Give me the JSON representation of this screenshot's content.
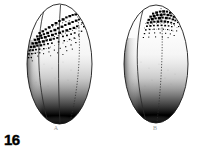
{
  "figure": {
    "number": "16",
    "domain_type": "scientific-illustration",
    "background_color": "#ffffff",
    "ink_color": "#000000",
    "label_color": "#9a9a9a",
    "width": 200,
    "height": 154
  },
  "panels": [
    {
      "id": "A",
      "label": "A",
      "label_x": 56,
      "label_y": 128,
      "egg": {
        "center_x": 59.5,
        "center_y": 64,
        "radius_x": 32.5,
        "radius_y": 60,
        "outline_color": "#1a1a1a",
        "outline_width": 0.9
      },
      "meridians": [
        {
          "name": "left-meridian",
          "top_x": 44,
          "bottom_x": 50,
          "style": "solid"
        },
        {
          "name": "center-meridian",
          "top_x": 60,
          "bottom_x": 60,
          "style": "solid"
        },
        {
          "name": "right-meridian-dotted",
          "top_x": 76,
          "bottom_x": 70,
          "style": "dotted"
        }
      ],
      "pigment_patch": {
        "name": "animal-pole-pigment",
        "description": "dense dark stipple patch at animal pole, spreading left and down",
        "center_x": 56,
        "center_y": 26,
        "extent_x": 30,
        "extent_y": 22,
        "dot_count": 150,
        "seed": 11
      },
      "vegetal_pole": {
        "name": "vegetal-pole-shading",
        "description": "solid black crescent at bottom with graded stipple above",
        "color": "#000000"
      }
    },
    {
      "id": "B",
      "label": "B",
      "label_x": 155,
      "label_y": 128,
      "egg": {
        "center_x": 156,
        "center_y": 64,
        "radius_x": 32,
        "radius_y": 59,
        "outline_color": "#1a1a1a",
        "outline_width": 0.9
      },
      "meridians": [
        {
          "name": "left-meridian",
          "top_x": 143,
          "bottom_x": 147,
          "style": "solid"
        },
        {
          "name": "center-meridian-dotted",
          "top_x": 161,
          "bottom_x": 158,
          "style": "dotted"
        }
      ],
      "pigment_patch": {
        "name": "animal-pole-pigment",
        "description": "compact dark stipple patch at animal pole",
        "center_x": 160,
        "center_y": 20,
        "extent_x": 19,
        "extent_y": 14,
        "dot_count": 70,
        "seed": 29
      },
      "vegetal_pole": {
        "name": "vegetal-pole-shading",
        "description": "solid black crescent at bottom with graded stipple above",
        "color": "#000000"
      }
    }
  ]
}
